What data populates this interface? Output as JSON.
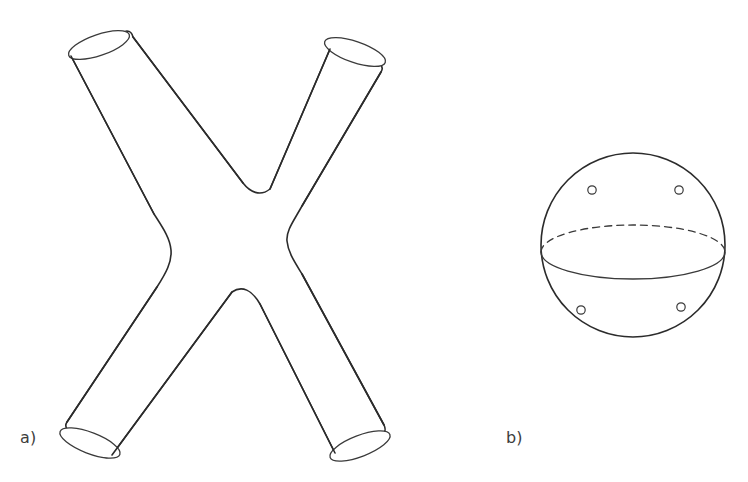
{
  "figure": {
    "background_color": "#ffffff",
    "stroke_color": "#2b2b2b",
    "width": 748,
    "height": 482
  },
  "panels": [
    {
      "id": "a",
      "label": "a)",
      "caption": "X-shaped tube surface with four open cylindrical ends",
      "description": "Four-legged tube (doubled pair of pants) drawn in 3D with elliptical open boundary circles at each of the four leg ends",
      "leg_count": 4,
      "open_ends": 4,
      "legs": [
        {
          "name": "top-left-leg",
          "end_center": [
            97,
            47
          ],
          "end_rx": 30,
          "end_ry": 10,
          "end_rotation": -34
        },
        {
          "name": "top-right-leg",
          "end_center": [
            357,
            44
          ],
          "end_rx": 30,
          "end_ry": 10,
          "end_rotation": 31
        },
        {
          "name": "bottom-left-leg",
          "end_center": [
            92,
            440
          ],
          "end_rx": 30,
          "end_ry": 10,
          "end_rotation": 31
        },
        {
          "name": "bottom-right-leg",
          "end_center": [
            362,
            443
          ],
          "end_rx": 30,
          "end_ry": 10,
          "end_rotation": -33
        }
      ],
      "waist": {
        "top_notch": [
          222,
          203
        ],
        "bottom_notch": [
          226,
          288
        ],
        "left_bulge": [
          162,
          246
        ],
        "right_bulge": [
          289,
          240
        ]
      }
    },
    {
      "id": "b",
      "label": "b)",
      "caption": "Sphere with four punctures and an equatorial circle",
      "description": "Circle representing a sphere, with a dashed rear equator arc, a solid front equator arc, and four small circles marking punctures",
      "sphere": {
        "center": [
          633,
          245
        ],
        "radius": 92
      },
      "equator": {
        "center": [
          633,
          252
        ],
        "rx": 92,
        "ry": 27,
        "back_style": "dashed",
        "front_style": "solid"
      },
      "punctures": [
        {
          "name": "puncture-top-left",
          "cx": 592,
          "cy": 190,
          "r": 4.2
        },
        {
          "name": "puncture-top-right",
          "cx": 679,
          "cy": 190,
          "r": 4.2
        },
        {
          "name": "puncture-bottom-left",
          "cx": 581,
          "cy": 310,
          "r": 4.2
        },
        {
          "name": "puncture-bottom-right",
          "cx": 681,
          "cy": 307,
          "r": 4.2
        }
      ],
      "puncture_count": 4
    }
  ]
}
